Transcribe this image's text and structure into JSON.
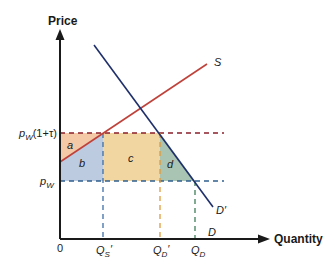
{
  "axes": {
    "y_label": "Price",
    "x_label": "Quantity",
    "origin_label": "0"
  },
  "price_levels": {
    "tariff_price": "pW(1+τ)",
    "tariff_price_main": "p",
    "tariff_price_sub": "W",
    "tariff_price_suffix": "(1+τ)",
    "world_price_main": "p",
    "world_price_sub": "W"
  },
  "quantities": [
    {
      "main": "Q",
      "sub": "S",
      "prime": "′"
    },
    {
      "main": "Q",
      "sub": "D",
      "prime": "′"
    },
    {
      "main": "Q",
      "sub": "D",
      "prime": ""
    }
  ],
  "curves": {
    "supply_label": "S",
    "demand_label": "D′",
    "demand_axis_label": "D"
  },
  "regions": {
    "a": "a",
    "b": "b",
    "c": "c",
    "d": "d"
  },
  "colors": {
    "supply": "#c0413a",
    "demand": "#1f2f6b",
    "region_a": "#f3c9a8",
    "region_b": "#bccbe0",
    "region_c": "#f2d6a2",
    "region_d": "#a9c4b2",
    "dash_tariff": "#8b1e2a",
    "dash_world": "#2f5f8f",
    "dash_qs": "#3f6fa8",
    "dash_qdp": "#e09a3a",
    "dash_qd": "#3f7f58"
  }
}
